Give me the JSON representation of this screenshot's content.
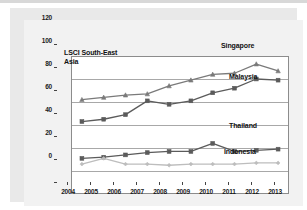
{
  "figure": {
    "title_line1": "LSCI South-East",
    "title_line2": "Asia"
  },
  "chart_data": {
    "type": "line",
    "title": "LSCI South-East Asia",
    "xlabel": "",
    "ylabel": "",
    "ylim": [
      0,
      120
    ],
    "yticks": [
      0,
      20,
      40,
      60,
      80,
      100,
      120
    ],
    "grid": true,
    "legend_position": "right-inline",
    "categories": [
      "2004",
      "2005",
      "2006",
      "2007",
      "2008",
      "2009",
      "2010",
      "2011",
      "2012",
      "2013"
    ],
    "x": [
      2004,
      2005,
      2006,
      2007,
      2008,
      2009,
      2010,
      2011,
      2012,
      2013
    ],
    "series": [
      {
        "name": "Singapore",
        "marker": "triangle",
        "color": "#7a7a7a",
        "values": [
          82,
          84,
          86,
          87,
          94,
          99,
          104,
          105,
          113,
          107
        ]
      },
      {
        "name": "Malaysia",
        "marker": "square",
        "color": "#5b5b5b",
        "values": [
          63,
          65,
          69,
          81,
          78,
          81,
          88,
          92,
          100,
          99
        ]
      },
      {
        "name": "Thailand",
        "marker": "square",
        "color": "#5b5b5b",
        "values": [
          31,
          32,
          34,
          36,
          37,
          37,
          44,
          37,
          38,
          39
        ]
      },
      {
        "name": "Indonesia",
        "marker": "diamond",
        "color": "#bdbdbd",
        "values": [
          26,
          31,
          26,
          26,
          25,
          26,
          26,
          26,
          27,
          27
        ]
      }
    ]
  },
  "yticks": {
    "t0": "0",
    "t1": "20",
    "t2": "40",
    "t3": "60",
    "t4": "80",
    "t5": "100",
    "t6": "120"
  },
  "xticks": {
    "t0": "2004",
    "t1": "2005",
    "t2": "2006",
    "t3": "2007",
    "t4": "2008",
    "t5": "2009",
    "t6": "2010",
    "t7": "2011",
    "t8": "2012",
    "t9": "2013"
  },
  "series_labels": {
    "singapore": "Singapore",
    "malaysia": "Malaysia",
    "thailand": "Thailand",
    "indonesia": "Indonesia"
  },
  "colors": {
    "singapore": "#7a7a7a",
    "malaysia": "#5b5b5b",
    "thailand": "#5b5b5b",
    "indonesia": "#bdbdbd",
    "grid": "#a8a8a8",
    "panel": "#e9e9e9",
    "card": "#f2f2f2"
  }
}
